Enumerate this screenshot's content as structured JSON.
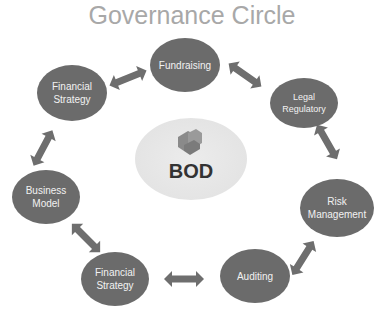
{
  "title": "Governance Circle",
  "center": {
    "label": "BOD",
    "icon": "puzzle-pieces-icon"
  },
  "nodes": [
    {
      "id": "fundraising",
      "label": "Fundraising"
    },
    {
      "id": "legal-regulatory",
      "label": "Legal Regulatory",
      "lines": [
        "Legal",
        "Regulatory"
      ]
    },
    {
      "id": "risk-management",
      "label": "Risk Management",
      "lines": [
        "Risk",
        "Management"
      ]
    },
    {
      "id": "auditing",
      "label": "Auditing"
    },
    {
      "id": "financial-strategy-bottom",
      "label": "Financial Strategy",
      "lines": [
        "Financial",
        "Strategy"
      ]
    },
    {
      "id": "business-model",
      "label": "Business Model",
      "lines": [
        "Business",
        "Model"
      ]
    },
    {
      "id": "financial-strategy-top",
      "label": "Financial Strategy",
      "lines": [
        "Financial",
        "Strategy"
      ]
    }
  ],
  "edges": [
    [
      "financial-strategy-top",
      "fundraising"
    ],
    [
      "fundraising",
      "legal-regulatory"
    ],
    [
      "legal-regulatory",
      "risk-management"
    ],
    [
      "risk-management",
      "auditing"
    ],
    [
      "auditing",
      "financial-strategy-bottom"
    ],
    [
      "financial-strategy-bottom",
      "business-model"
    ],
    [
      "business-model",
      "financial-strategy-top"
    ]
  ],
  "colors": {
    "node": "#6b6b6b",
    "arrow": "#6e6e6e",
    "title": "#a8a8a8",
    "center": "#e6e6e6"
  }
}
